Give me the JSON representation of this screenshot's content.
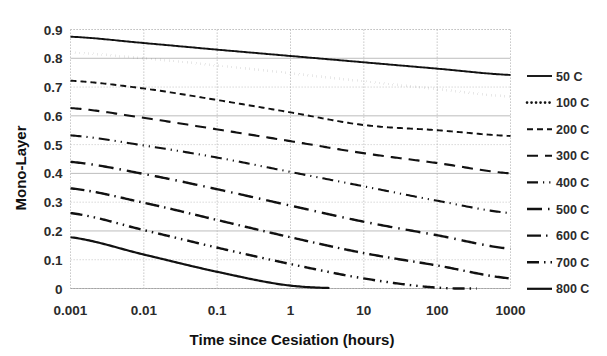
{
  "chart_data": {
    "type": "line",
    "title": "",
    "xlabel": "Time since Cesiation (hours)",
    "ylabel": "Mono-Layer",
    "xscale": "log",
    "yscale": "linear",
    "xlim": [
      0.001,
      1000
    ],
    "ylim": [
      0,
      0.9
    ],
    "grid": true,
    "legend_position": "right",
    "x_tick_labels": [
      "0.001",
      "0.01",
      "0.1",
      "1",
      "10",
      "100",
      "1000"
    ],
    "x_ticks": [
      0.001,
      0.01,
      0.1,
      1,
      10,
      100,
      1000
    ],
    "y_tick_labels": [
      "0",
      "0.1",
      "0.2",
      "0.3",
      "0.4",
      "0.5",
      "0.6",
      "0.7",
      "0.8",
      "0.9"
    ],
    "y_ticks": [
      0,
      0.1,
      0.2,
      0.3,
      0.4,
      0.5,
      0.6,
      0.7,
      0.8,
      0.9
    ],
    "x": [
      0.001,
      0.01,
      0.1,
      1,
      10,
      100,
      1000
    ],
    "series": [
      {
        "name": "50 C",
        "dash": "solid",
        "stroke_width": 1.9,
        "dasharray": "none",
        "values": [
          0.875,
          0.853,
          0.83,
          0.808,
          0.786,
          0.764,
          0.742
        ]
      },
      {
        "name": "100 C",
        "dash": "dotted",
        "stroke_width": 2.6,
        "dasharray": "0.1 4.4",
        "values": [
          0.82,
          0.8,
          0.775,
          0.748,
          0.72,
          0.693,
          0.667
        ]
      },
      {
        "name": "200 C",
        "dash": "dashed-short",
        "stroke_width": 1.9,
        "dasharray": "6 4",
        "values": [
          0.722,
          0.695,
          0.655,
          0.612,
          0.568,
          0.55,
          0.53
        ]
      },
      {
        "name": "300 C",
        "dash": "dashed-medium",
        "stroke_width": 2.1,
        "dasharray": "11 7",
        "values": [
          0.627,
          0.593,
          0.553,
          0.512,
          0.47,
          0.436,
          0.4
        ]
      },
      {
        "name": "400 C",
        "dash": "dash-dot-dot",
        "stroke_width": 2.1,
        "dasharray": "11 5 1.2 5 1.2 5",
        "values": [
          0.532,
          0.497,
          0.455,
          0.405,
          0.355,
          0.305,
          0.262
        ]
      },
      {
        "name": "500 C",
        "dash": "dash-dot",
        "stroke_width": 2.4,
        "dasharray": "15 6 1.5 6",
        "values": [
          0.44,
          0.398,
          0.345,
          0.288,
          0.232,
          0.185,
          0.138
        ]
      },
      {
        "name": "600 C",
        "dash": "dash-dot-long",
        "stroke_width": 2.4,
        "dasharray": "14 5 1.5 5",
        "values": [
          0.348,
          0.298,
          0.238,
          0.178,
          0.123,
          0.08,
          0.035
        ]
      },
      {
        "name": "700 C",
        "dash": "dash-dot-dot-long",
        "stroke_width": 2.4,
        "dasharray": "12 5 1.5 5 1.5 5",
        "values": [
          0.262,
          0.203,
          0.142,
          0.085,
          0.035,
          0.003,
          0.0
        ]
      },
      {
        "name": "800 C",
        "dash": "solid",
        "stroke_width": 2.2,
        "dasharray": "none",
        "values": [
          0.178,
          0.118,
          0.058,
          0.01,
          0.0,
          0.0,
          0.0
        ]
      }
    ],
    "colors": {
      "line": "#111111",
      "grid": "#c2c2c2",
      "text": "#2b2b2b",
      "background": "#ffffff"
    }
  },
  "legend": {
    "entries": [
      {
        "label": "50 C"
      },
      {
        "label": "100 C"
      },
      {
        "label": "200 C"
      },
      {
        "label": "300 C"
      },
      {
        "label": "400 C"
      },
      {
        "label": "500 C"
      },
      {
        "label": "600 C"
      },
      {
        "label": "700 C"
      },
      {
        "label": "800 C"
      }
    ]
  },
  "axes": {
    "x_title": "Time since Cesiation (hours)",
    "y_title": "Mono-Layer"
  }
}
